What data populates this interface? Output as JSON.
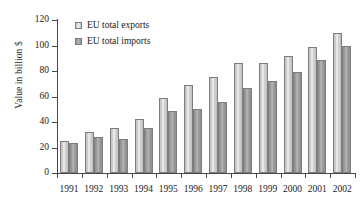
{
  "chart_data": {
    "type": "bar",
    "title": "",
    "xlabel": "",
    "ylabel": "Value in billion $",
    "ylim": [
      0,
      120
    ],
    "yticks": [
      0,
      20,
      40,
      60,
      80,
      100,
      120
    ],
    "grid": false,
    "legend_position": "top-left",
    "categories": [
      "1991",
      "1992",
      "1993",
      "1994",
      "1995",
      "1996",
      "1997",
      "1998",
      "1999",
      "2000",
      "2001",
      "2002"
    ],
    "series": [
      {
        "name": "EU total exports",
        "color": "#cccccc",
        "values": [
          25.5,
          32.5,
          35,
          42.5,
          59,
          69,
          75,
          86,
          86,
          92,
          98.5,
          109.5
        ]
      },
      {
        "name": "EU total imports",
        "color": "#969696",
        "values": [
          23.5,
          28,
          27,
          35.5,
          48.5,
          50.5,
          56,
          67,
          72,
          79.5,
          89,
          99.5
        ]
      }
    ]
  },
  "legend": {
    "items": [
      {
        "label": "EU total exports"
      },
      {
        "label": "EU total imports"
      }
    ]
  }
}
